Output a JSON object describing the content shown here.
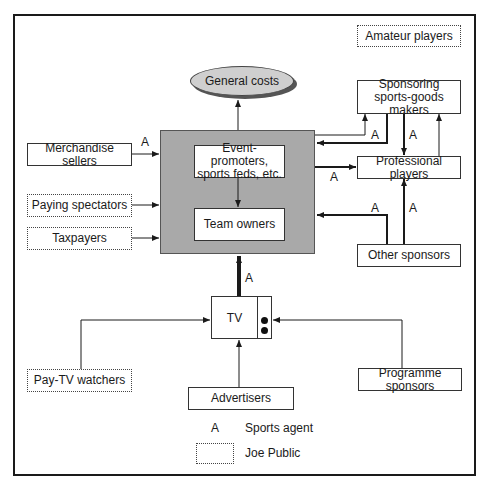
{
  "diagram": {
    "nodes": {
      "general_costs": "General costs",
      "event_promoters": "Event-promoters, sports feds, etc.",
      "team_owners": "Team owners",
      "merchandise_sellers": "Merchandise sellers",
      "paying_spectators": "Paying spectators",
      "taxpayers": "Taxpayers",
      "amateur_players": "Amateur players",
      "sponsoring_makers": "Sponsoring sports-goods makers",
      "professional_players": "Professional players",
      "other_sponsors": "Other sponsors",
      "tv": "TV",
      "pay_tv_watchers": "Pay-TV watchers",
      "advertisers": "Advertisers",
      "programme_sponsors": "Programme sponsors"
    },
    "agent_label": "A",
    "legend": {
      "agent_symbol": "A",
      "agent_text": "Sports agent",
      "public_text": "Joe Public"
    },
    "colors": {
      "core_fill": "#a9a9a9",
      "ellipse_fill": "#cfcfcf",
      "line": "#1a1a1a"
    }
  }
}
